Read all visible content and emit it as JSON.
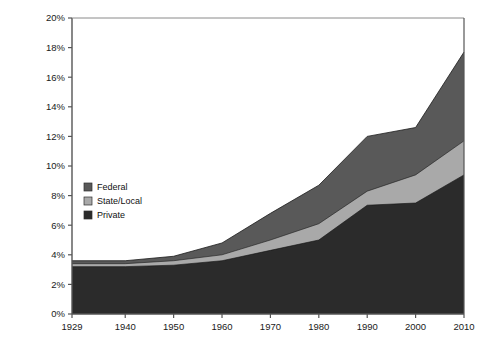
{
  "chart_data": {
    "type": "area",
    "stacked": true,
    "title": "",
    "subtitle": "",
    "xlabel": "",
    "ylabel": "",
    "x": [
      1929,
      1940,
      1950,
      1960,
      1970,
      1980,
      1990,
      2000,
      2010
    ],
    "categories": [
      "1929",
      "1940",
      "1950",
      "1960",
      "1970",
      "1980",
      "1990",
      "2000",
      "2010"
    ],
    "xlim": [
      1929,
      2010
    ],
    "ylim": [
      0,
      20
    ],
    "ytick_labels": [
      "0%",
      "2%",
      "4%",
      "6%",
      "8%",
      "10%",
      "12%",
      "14%",
      "16%",
      "18%",
      "20%"
    ],
    "ytick_values": [
      0,
      2,
      4,
      6,
      8,
      10,
      12,
      14,
      16,
      18,
      20
    ],
    "xtick_labels": [
      "1929",
      "1940",
      "1950",
      "1960",
      "1970",
      "1980",
      "1990",
      "2000",
      "2010"
    ],
    "xtick_values": [
      1929,
      1940,
      1950,
      1960,
      1970,
      1980,
      1990,
      2000,
      2010
    ],
    "grid": false,
    "units": "percent",
    "legend_position": "inner-left",
    "stack_order_bottom_to_top": [
      "Private",
      "State/Local",
      "Federal"
    ],
    "series": [
      {
        "name": "Private",
        "color": "#2b2b2b",
        "values": [
          3.2,
          3.2,
          3.3,
          3.6,
          4.3,
          5.0,
          7.35,
          7.5,
          9.4
        ]
      },
      {
        "name": "State/Local",
        "color": "#a9a9a9",
        "values": [
          0.2,
          0.2,
          0.3,
          0.4,
          0.7,
          1.1,
          0.95,
          1.9,
          2.3
        ]
      },
      {
        "name": "Federal",
        "color": "#595959",
        "values": [
          0.2,
          0.2,
          0.3,
          0.8,
          1.8,
          2.6,
          3.7,
          3.2,
          6.0
        ]
      }
    ],
    "series_cumulative_tops": [
      {
        "name": "Private",
        "values": [
          3.2,
          3.2,
          3.3,
          3.6,
          4.3,
          5.0,
          7.35,
          7.5,
          9.4
        ]
      },
      {
        "name": "State/Local",
        "values": [
          3.4,
          3.4,
          3.6,
          4.0,
          5.0,
          6.1,
          8.3,
          9.4,
          11.7
        ]
      },
      {
        "name": "Federal",
        "values": [
          3.6,
          3.6,
          3.9,
          4.8,
          6.8,
          8.7,
          12.0,
          12.6,
          17.7
        ]
      }
    ],
    "legend": [
      {
        "label": "Federal",
        "color": "#595959",
        "swatch": "legend-swatch-federal"
      },
      {
        "label": "State/Local",
        "color": "#a9a9a9",
        "swatch": "legend-swatch-state-local"
      },
      {
        "label": "Private",
        "color": "#2b2b2b",
        "swatch": "legend-swatch-private"
      }
    ],
    "axis_color": "#555555",
    "plot_background": "#ffffff"
  }
}
